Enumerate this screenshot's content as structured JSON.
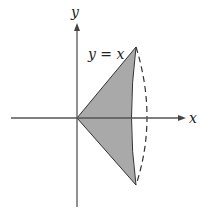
{
  "diagram": {
    "axes": {
      "x_label": "x",
      "y_label": "y"
    },
    "curve_label": "y = x",
    "colors": {
      "axis": "#555555",
      "region_fill": "#a9a9a9",
      "region_stroke": "#333333",
      "dashed": "#333333",
      "text": "#222222"
    },
    "region": {
      "description": "Shaded region bounded by y = x, y = -x and a curved right edge, revolved about the x-axis (dashed back edge)"
    }
  }
}
